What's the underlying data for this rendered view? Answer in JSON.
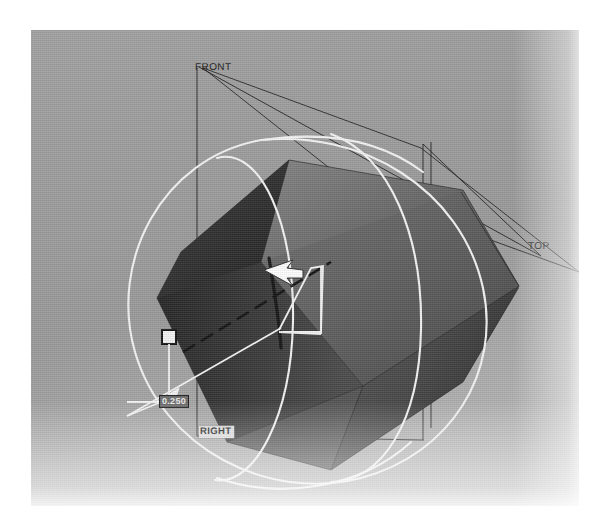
{
  "app": {
    "kind": "cad-3d-viewport",
    "background_color": "#9a9a9a",
    "page_background_color": "#ffffff"
  },
  "viewport": {
    "name": "graphics-area",
    "x": 31,
    "y": 30,
    "width": 548,
    "height": 476
  },
  "datum_planes": [
    {
      "id": "front",
      "label": "FRONT",
      "color": "#1b1b1b"
    },
    {
      "id": "top",
      "label": "TOP",
      "color": "#1b1b1b"
    },
    {
      "id": "right",
      "label": "RIGHT",
      "color": "#232323",
      "highlighted": true,
      "highlight_color": "#dfdfdf"
    }
  ],
  "dimension": {
    "name": "extrude-depth",
    "value": "0.250",
    "text_color": "#ededed",
    "box_color": "#6d6d6d",
    "border_color": "#1a1a1a"
  },
  "handles": {
    "drag_handle": {
      "name": "extrude-drag-handle",
      "fill": "#f2f2f2",
      "stroke": "#151515"
    }
  },
  "cursor": {
    "name": "arrow-cursor",
    "fill": "#ffffff",
    "stroke": "#2a2a2a",
    "direction": "left"
  },
  "geometry": {
    "solid": {
      "name": "hexagonal-prism-body",
      "shading": [
        "#2c2c2c",
        "#3a3a3a",
        "#4d4d4d",
        "#5b5b5b",
        "#6b6b6b",
        "#7a7a7a",
        "#868686"
      ]
    },
    "sketch_overlay": {
      "name": "cylinder-sketch",
      "color": "#f4f4f4",
      "description": "white circular sketch profile and swept silhouette"
    },
    "axis": {
      "name": "temporary-axis",
      "style": "dashed",
      "color": "#141414"
    }
  },
  "colors": {
    "plane_line": "#1f1f1f",
    "sketch_white": "#f4f4f4",
    "background": "#9a9a9a"
  }
}
